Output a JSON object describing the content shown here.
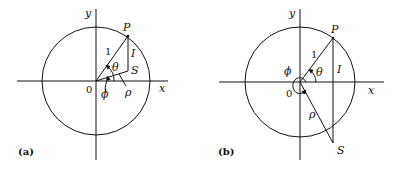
{
  "figure": {
    "panels": [
      {
        "caption": "(a)",
        "axis_x": "x",
        "axis_y": "y",
        "origin": "0",
        "point_P": "P",
        "point_S": "S",
        "segment_OP": "1",
        "segment_PS": "I",
        "segment_OS": "ρ",
        "angle_theta": "θ",
        "angle_phi": "ϕ"
      },
      {
        "caption": "(b)",
        "axis_x": "x",
        "axis_y": "y",
        "origin": "0",
        "point_P": "P",
        "point_S": "S",
        "segment_OP": "1",
        "segment_PS": "I",
        "segment_OS": "ρ",
        "angle_theta": "θ",
        "angle_phi": "ϕ"
      }
    ]
  }
}
